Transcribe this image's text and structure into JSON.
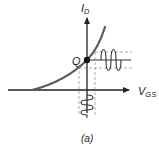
{
  "diagram": {
    "type": "mosfet-transfer-characteristic",
    "y_axis": {
      "label_main": "I",
      "label_sub": "D"
    },
    "x_axis": {
      "label_main": "V",
      "label_sub": "GS"
    },
    "q_point": {
      "label": "Q"
    },
    "caption": "(a)",
    "colors": {
      "curve": "#555555",
      "axes": "#222222",
      "dashed": "#999999",
      "signal": "#333333"
    }
  }
}
